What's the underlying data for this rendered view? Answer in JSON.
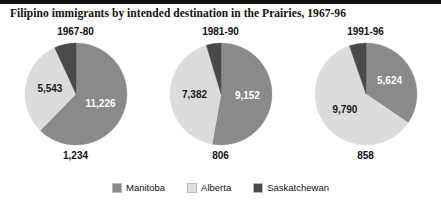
{
  "figure": {
    "title": "Filipino immigrants by intended destination in the Prairies, 1967-96"
  },
  "legend": {
    "items": [
      {
        "label": "Manitoba",
        "color": "#8a8a8a",
        "key": "manitoba"
      },
      {
        "label": "Alberta",
        "color": "#dcdcdc",
        "key": "alberta"
      },
      {
        "label": "Saskatchewan",
        "color": "#4a4a4a",
        "key": "saskatchewan"
      }
    ]
  },
  "panels": [
    {
      "title": "1967-80",
      "inside_labels": [
        {
          "text": "11,226",
          "series": "Manitoba"
        },
        {
          "text": "5,543",
          "series": "Alberta"
        }
      ],
      "outside_label": {
        "text": "1,234",
        "series": "Saskatchewan"
      }
    },
    {
      "title": "1981-90",
      "inside_labels": [
        {
          "text": "9,152",
          "series": "Manitoba"
        },
        {
          "text": "7,382",
          "series": "Alberta"
        }
      ],
      "outside_label": {
        "text": "806",
        "series": "Saskatchewan"
      }
    },
    {
      "title": "1991-96",
      "inside_labels": [
        {
          "text": "5,624",
          "series": "Manitoba"
        },
        {
          "text": "9,790",
          "series": "Alberta"
        }
      ],
      "outside_label": {
        "text": "858",
        "series": "Saskatchewan"
      }
    }
  ],
  "chart_data": {
    "type": "pie",
    "title": "Filipino immigrants by intended destination in the Prairies, 1967-96",
    "xlabel": "",
    "ylabel": "",
    "legend_position": "bottom",
    "grid": false,
    "panel_titles": [
      "1967-80",
      "1981-90",
      "1991-96"
    ],
    "categories": [
      "Manitoba",
      "Alberta",
      "Saskatchewan"
    ],
    "colors": [
      "#8a8a8a",
      "#dcdcdc",
      "#4a4a4a"
    ],
    "panels": [
      {
        "name": "1967-80",
        "slices": [
          {
            "label": "Manitoba",
            "value": 11226,
            "color": "#8a8a8a"
          },
          {
            "label": "Alberta",
            "value": 5543,
            "color": "#dcdcdc"
          },
          {
            "label": "Saskatchewan",
            "value": 1234,
            "color": "#4a4a4a"
          }
        ],
        "total": 18003
      },
      {
        "name": "1981-90",
        "slices": [
          {
            "label": "Manitoba",
            "value": 9152,
            "color": "#8a8a8a"
          },
          {
            "label": "Alberta",
            "value": 7382,
            "color": "#dcdcdc"
          },
          {
            "label": "Saskatchewan",
            "value": 806,
            "color": "#4a4a4a"
          }
        ],
        "total": 17340
      },
      {
        "name": "1991-96",
        "slices": [
          {
            "label": "Manitoba",
            "value": 5624,
            "color": "#8a8a8a"
          },
          {
            "label": "Alberta",
            "value": 9790,
            "color": "#dcdcdc"
          },
          {
            "label": "Saskatchewan",
            "value": 858,
            "color": "#4a4a4a"
          }
        ],
        "total": 16272
      }
    ]
  }
}
